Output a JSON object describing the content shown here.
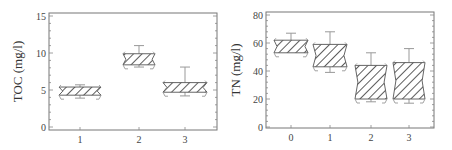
{
  "chart_data": [
    {
      "type": "box",
      "title": "",
      "xlabel": "",
      "ylabel": "TOC (mg/l)",
      "ylim": [
        0,
        15
      ],
      "yticks": [
        "0",
        "5",
        "10",
        "15"
      ],
      "categories": [
        "1",
        "2",
        "3"
      ],
      "boxes": [
        {
          "category": "1",
          "q1": 4.3,
          "q3": 5.4,
          "whisker_low": 3.9,
          "whisker_high": 5.7
        },
        {
          "category": "2",
          "q1": 8.4,
          "q3": 9.9,
          "whisker_low": 8.1,
          "whisker_high": 11.0
        },
        {
          "category": "3",
          "q1": 4.7,
          "q3": 6.0,
          "whisker_low": 4.2,
          "whisker_high": 8.1
        }
      ],
      "grid": false,
      "legend": null
    },
    {
      "type": "box",
      "title": "",
      "xlabel": "",
      "ylabel": "TN (mg/l)",
      "ylim": [
        0,
        80
      ],
      "yticks": [
        "0",
        "20",
        "40",
        "60",
        "80"
      ],
      "categories": [
        "0",
        "1",
        "2",
        "3"
      ],
      "boxes": [
        {
          "category": "0",
          "q1": 53,
          "q3": 62,
          "whisker_low": 53,
          "whisker_high": 67
        },
        {
          "category": "1",
          "q1": 43,
          "q3": 59,
          "whisker_low": 39,
          "whisker_high": 68
        },
        {
          "category": "2",
          "q1": 20,
          "q3": 44,
          "whisker_low": 18,
          "whisker_high": 53
        },
        {
          "category": "3",
          "q1": 20,
          "q3": 46,
          "whisker_low": 17,
          "whisker_high": 56
        }
      ],
      "grid": false,
      "legend": null
    }
  ],
  "colors": {
    "frame": "#777777",
    "hatch": "#333333",
    "whisker": "#999999",
    "text": "#444444"
  }
}
